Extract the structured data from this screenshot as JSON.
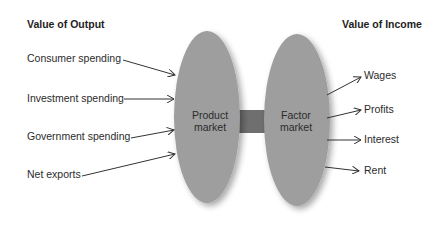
{
  "diagram": {
    "type": "circular-flow",
    "left_heading": "Value of Output",
    "right_heading": "Value of Income",
    "product_market": {
      "label_line1": "Product",
      "label_line2": "market"
    },
    "factor_market": {
      "label_line1": "Factor",
      "label_line2": "market"
    },
    "inputs": [
      {
        "label": "Consumer spending"
      },
      {
        "label": "Investment spending"
      },
      {
        "label": "Government spending"
      },
      {
        "label": "Net exports"
      }
    ],
    "outputs": [
      {
        "label": "Wages"
      },
      {
        "label": "Profits"
      },
      {
        "label": "Interest"
      },
      {
        "label": "Rent"
      }
    ],
    "colors": {
      "ellipse_fill": "#9e9e9e",
      "connector_fill": "#6f6f6f",
      "arrow_stroke": "#333333",
      "text": "#2b2b2b"
    }
  }
}
